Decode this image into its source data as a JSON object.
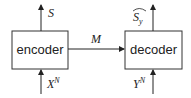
{
  "diagram": {
    "type": "block-diagram",
    "blocks": [
      {
        "id": "encoder",
        "label": "encoder"
      },
      {
        "id": "decoder",
        "label": "decoder"
      }
    ],
    "edges": [
      {
        "from": "encoder",
        "to": "decoder",
        "label": "M"
      }
    ],
    "encoder_io": {
      "input": {
        "base": "X",
        "sup": "N"
      },
      "output": {
        "base": "S"
      }
    },
    "decoder_io": {
      "input": {
        "base": "Y",
        "sup": "N"
      },
      "output": {
        "base": "S",
        "sub": "y",
        "hat": "︵"
      }
    }
  }
}
